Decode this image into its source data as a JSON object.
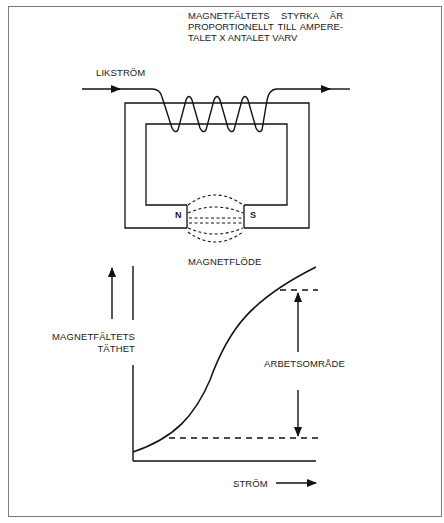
{
  "diagram": {
    "type": "electromagnet-and-magnetization-curve",
    "top_section": {
      "current_label": "LIKSTRÖM",
      "annotation_lines": [
        "MAGNETFÄLTETS STYRKA ÄR",
        "PROPORTIONELLT TILL AMPERE-",
        "TALET X ANTALET VARV"
      ],
      "north_pole_label": "N",
      "south_pole_label": "S",
      "flux_label": "MAGNETFLÖDE",
      "coil_turns": 4
    },
    "graph_section": {
      "y_axis_label_lines": [
        "MAGNETFÄLTETS",
        "TÄTHET"
      ],
      "x_axis_label": "STRÖM",
      "range_label": "ARBETSOMRÅDE"
    },
    "colors": {
      "line": "#111111",
      "frame": "#7a7a7a",
      "background": "#ffffff"
    }
  }
}
